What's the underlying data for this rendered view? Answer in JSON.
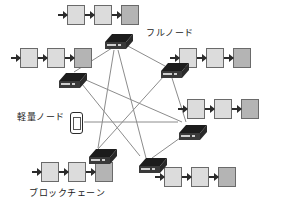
{
  "diagram": {
    "background_color": "#ffffff",
    "line_color": "#8c8c8c",
    "block_border_color": "#6a6a6a",
    "block_light_color": "#dcdcdc",
    "block_dark_color": "#b4b4b4",
    "node_color": "#262626",
    "text_color": "#1a1a1a"
  },
  "labels": [
    {
      "id": "full-node",
      "text": "フルノード",
      "x": 146,
      "y": 29
    },
    {
      "id": "light-node",
      "text": "軽量ノード",
      "x": 17,
      "y": 113
    },
    {
      "id": "blockchain",
      "text": "ブロックチェーン",
      "x": 29,
      "y": 189
    }
  ],
  "full_nodes": [
    {
      "id": "node-top",
      "name": "full-node-top",
      "x": 104,
      "y": 33
    },
    {
      "id": "node-left",
      "name": "full-node-left",
      "x": 58,
      "y": 72
    },
    {
      "id": "node-upper-right",
      "name": "full-node-upper-right",
      "x": 160,
      "y": 62
    },
    {
      "id": "node-right",
      "name": "full-node-right",
      "x": 178,
      "y": 124
    },
    {
      "id": "node-bottom-left",
      "name": "full-node-bottom-left",
      "x": 88,
      "y": 148
    },
    {
      "id": "node-bottom-right",
      "name": "full-node-bottom-right",
      "x": 138,
      "y": 157
    }
  ],
  "light_node": {
    "id": "node-phone",
    "name": "lightweight-node-smartphone",
    "x": 70,
    "y": 112
  },
  "chains": [
    {
      "id": "chain-top",
      "name": "blockchain-top",
      "x": 58,
      "y": 5,
      "blocks": [
        "light",
        "light",
        "dark"
      ]
    },
    {
      "id": "chain-left",
      "name": "blockchain-left",
      "x": 11,
      "y": 48,
      "blocks": [
        "light",
        "light",
        "dark"
      ]
    },
    {
      "id": "chain-upper-right",
      "name": "blockchain-upper-right",
      "x": 170,
      "y": 48,
      "blocks": [
        "light",
        "light",
        "dark"
      ]
    },
    {
      "id": "chain-right",
      "name": "blockchain-right",
      "x": 178,
      "y": 99,
      "blocks": [
        "light",
        "light",
        "dark"
      ]
    },
    {
      "id": "chain-bottom-left",
      "name": "blockchain-bottom-left",
      "x": 32,
      "y": 162,
      "blocks": [
        "light",
        "light",
        "dark"
      ]
    },
    {
      "id": "chain-bottom-right",
      "name": "blockchain-bottom-right",
      "x": 155,
      "y": 167,
      "blocks": [
        "light",
        "light",
        "dark"
      ]
    }
  ],
  "edges": [
    {
      "from": "node-top",
      "to": "node-left",
      "x1": 112,
      "y1": 48,
      "x2": 74,
      "y2": 72
    },
    {
      "from": "node-top",
      "to": "node-upper-right",
      "x1": 126,
      "y1": 45,
      "x2": 165,
      "y2": 66
    },
    {
      "from": "node-top",
      "to": "node-bottom-right",
      "x1": 118,
      "y1": 50,
      "x2": 146,
      "y2": 158
    },
    {
      "from": "node-left",
      "to": "node-right",
      "x1": 86,
      "y1": 80,
      "x2": 182,
      "y2": 122
    },
    {
      "from": "node-left",
      "to": "node-bottom-right",
      "x1": 82,
      "y1": 84,
      "x2": 140,
      "y2": 156
    },
    {
      "from": "node-upper-right",
      "to": "node-right",
      "x1": 172,
      "y1": 78,
      "x2": 186,
      "y2": 122
    },
    {
      "from": "node-upper-right",
      "to": "node-bottom-left",
      "x1": 164,
      "y1": 76,
      "x2": 98,
      "y2": 149
    },
    {
      "from": "node-right",
      "to": "node-bottom-right",
      "x1": 180,
      "y1": 138,
      "x2": 152,
      "y2": 158
    },
    {
      "from": "node-phone",
      "to": "node-right",
      "x1": 84,
      "y1": 122,
      "x2": 178,
      "y2": 122
    },
    {
      "from": "node-bottom-left",
      "to": "node-top",
      "x1": 98,
      "y1": 148,
      "x2": 114,
      "y2": 50
    }
  ]
}
